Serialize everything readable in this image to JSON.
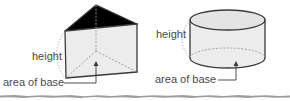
{
  "figures": [
    {
      "id": "triangular-prism",
      "shape": "triangular prism",
      "labels": {
        "height": "height",
        "base": "area of base"
      }
    },
    {
      "id": "cylinder",
      "shape": "cylinder",
      "labels": {
        "height": "height",
        "base": "area of base"
      }
    }
  ],
  "colors": {
    "face_fill": "#ececec",
    "top_fill": "#e4e4e4",
    "edge": "#3a3a3a",
    "hidden_edge": "#9a9a9a",
    "label_text": "#4a4a4a",
    "leader_line": "#3a3a3a",
    "torn_edge": "#8c8c8c"
  }
}
